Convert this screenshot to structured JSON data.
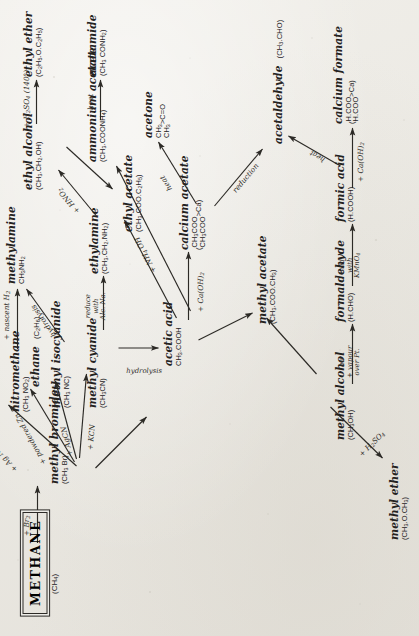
{
  "diagram": {
    "title": "METHANE",
    "title_formula": "(CH4)",
    "background_color": "#ecebe6",
    "ink_color": "#2c2a26",
    "orientation": "rotated-90-ccw",
    "nodes": [
      {
        "id": "methane",
        "name": "METHANE",
        "formula": "(CH4)"
      },
      {
        "id": "methyl-bromide",
        "name": "methyl bromide",
        "formula": "(CH3 Br)"
      },
      {
        "id": "nitromethane",
        "name": "nitromethane",
        "formula": "(CH3 NO2)"
      },
      {
        "id": "ethane",
        "name": "ethane",
        "formula": "(C2H6)"
      },
      {
        "id": "methyl-isocyanide",
        "name": "methyl isocyanide",
        "formula": "(CH3 NC)"
      },
      {
        "id": "methyl-cyanide",
        "name": "methyl cyanide",
        "formula": "(CH3CN)"
      },
      {
        "id": "methylamine",
        "name": "methylamine",
        "formula": "CH3NH2"
      },
      {
        "id": "ethylamine",
        "name": "ethylamine",
        "formula": "(CH3.CH2.NH2)"
      },
      {
        "id": "ethyl-alcohol",
        "name": "ethyl alcohol",
        "formula": "(CH3.CH2.OH)"
      },
      {
        "id": "ethyl-ether",
        "name": "ethyl ether",
        "formula": "(C2H5.O.C2H5)"
      },
      {
        "id": "ethyl-acetate",
        "name": "ethyl acetate",
        "formula": "(CH3.COO.C2H5)"
      },
      {
        "id": "acetic-acid",
        "name": "acetic acid",
        "formula": "CH3.COOH"
      },
      {
        "id": "methyl-acetate",
        "name": "methyl acetate",
        "formula": "(CH3.COO.CH3)"
      },
      {
        "id": "ammonium-acetate",
        "name": "ammonium acetate",
        "formula": "(CH3.COONH4)"
      },
      {
        "id": "acetamide",
        "name": "acetamide",
        "formula": "(CH3 CONH2)"
      },
      {
        "id": "calcium-acetate",
        "name": "calcium acetate",
        "formula": "(CH3COO / CH3COO) Ca"
      },
      {
        "id": "acetone",
        "name": "acetone",
        "formula": "(CH3 / CH3) C=O"
      },
      {
        "id": "acetaldehyde",
        "name": "acetaldehyde",
        "formula": "(CH3.CHO)"
      },
      {
        "id": "methyl-alcohol",
        "name": "methyl alcohol",
        "formula": "(CH3OH)"
      },
      {
        "id": "methyl-ether",
        "name": "methyl ether",
        "formula": "(CH3.O.CH3)"
      },
      {
        "id": "formaldehyde",
        "name": "formaldehyde",
        "formula": "(H.CHO)"
      },
      {
        "id": "formic-acid",
        "name": "formic acid",
        "formula": "(H.COOH)"
      },
      {
        "id": "calcium-formate",
        "name": "calcium formate",
        "formula": "(H.COO / H.COO) Ca"
      }
    ],
    "reactions": [
      {
        "from": "methane",
        "to": "methyl-bromide",
        "label": "+ Br2"
      },
      {
        "from": "methyl-bromide",
        "to": "nitromethane",
        "label": "+ Ag NO2"
      },
      {
        "from": "methyl-bromide",
        "to": "ethane",
        "label": "+ powdered Zn"
      },
      {
        "from": "methyl-bromide",
        "to": "methyl-isocyanide",
        "label": "+ AgCN"
      },
      {
        "from": "methyl-bromide",
        "to": "methyl-cyanide",
        "label": "+ KCN"
      },
      {
        "from": "methyl-bromide",
        "to": "methyl-alcohol",
        "label": ""
      },
      {
        "from": "nitromethane",
        "to": "methylamine",
        "label": "+ nascent H2"
      },
      {
        "from": "methyl-isocyanide",
        "to": "methylamine",
        "label": "hydrolysis"
      },
      {
        "from": "methyl-cyanide",
        "to": "ethylamine",
        "label": "reduce with Alc. Na."
      },
      {
        "from": "methyl-cyanide",
        "to": "acetic-acid",
        "label": "hydrolysis"
      },
      {
        "from": "ethylamine",
        "to": "ethyl-alcohol",
        "label": "+ HNO2"
      },
      {
        "from": "ethyl-alcohol",
        "to": "ethyl-ether",
        "label": "+ H2SO4 (140°)"
      },
      {
        "from": "ethyl-alcohol",
        "to": "ethyl-acetate",
        "label": ""
      },
      {
        "from": "acetic-acid",
        "to": "ethyl-acetate",
        "label": ""
      },
      {
        "from": "acetic-acid",
        "to": "methyl-acetate",
        "label": ""
      },
      {
        "from": "methyl-alcohol",
        "to": "methyl-acetate",
        "label": ""
      },
      {
        "from": "acetic-acid",
        "to": "ammonium-acetate",
        "label": "+ NH4 OH"
      },
      {
        "from": "ammonium-acetate",
        "to": "acetamide",
        "label": "heat"
      },
      {
        "from": "acetic-acid",
        "to": "calcium-acetate",
        "label": "+ Ca(OH)2"
      },
      {
        "from": "calcium-acetate",
        "to": "acetone",
        "label": "heat"
      },
      {
        "from": "calcium-acetate",
        "to": "acetaldehyde",
        "label": "reduction"
      },
      {
        "from": "methyl-alcohol",
        "to": "methyl-ether",
        "label": "+ H2SO4"
      },
      {
        "from": "methyl-alcohol",
        "to": "formaldehyde",
        "label": "air + vapour over Pt."
      },
      {
        "from": "formaldehyde",
        "to": "formic-acid",
        "label": "oxid. with KMnO4"
      },
      {
        "from": "formic-acid",
        "to": "calcium-formate",
        "label": "+ Ca(OH)2"
      },
      {
        "from": "calcium-formate",
        "to": "acetaldehyde",
        "label": "heat"
      }
    ],
    "labels": {
      "br2": "+ Br",
      "br2_sub": "2",
      "ag_no2": "+ Ag NO",
      "ag_no2_sub": "2",
      "powdered_zn": "+ powdered Zn",
      "agcn": "+ AgCN",
      "kcn": "+ KCN",
      "nascent_h2": "+ nascent H",
      "nascent_h2_sub": "2",
      "hydrolysis": "hydrolysis",
      "reduce": "reduce",
      "with": "with",
      "alc_na": "Alc. Na.",
      "hydrolysis2": "hydrolysis",
      "hno2": "+ HNO",
      "hno2_sub": "2",
      "h2so4_140": "+ H",
      "h2so4_140b": "SO",
      "h2so4_140c": "(140°)",
      "nh4oh": "+ NH",
      "nh4oh_b": "OH",
      "heat_acetamide": "heat",
      "caoh2_acetate": "+ Ca(OH)",
      "caoh2_sub": "2",
      "heat_acetone": "heat",
      "reduction": "reduction",
      "h2so4_ether": "+ H",
      "h2so4_ether_b": "SO",
      "air": "air",
      "vapour": "+ vapour",
      "over_pt": "over Pt.",
      "oxid": "oxid.",
      "with2": "with",
      "kmno4": "KMnO",
      "kmno4_sub": "4",
      "caoh2_formate": "+ Ca(OH)",
      "caoh2_formate_sub": "2",
      "heat_acetaldehyde": "heat"
    }
  }
}
